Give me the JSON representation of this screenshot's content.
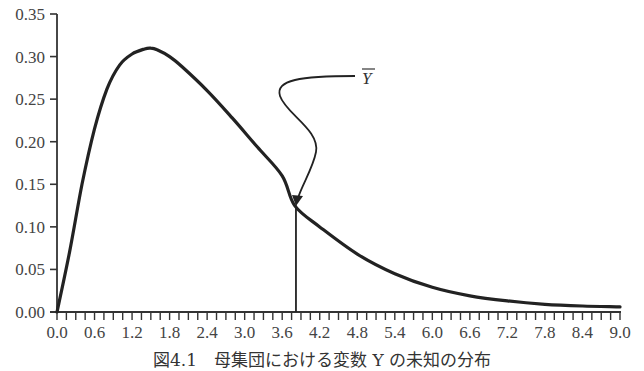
{
  "chart_data": {
    "type": "line",
    "title": "",
    "caption": "図4.1　母集団における変数 Y の未知の分布",
    "xlabel": "",
    "ylabel": "",
    "xlim": [
      0.0,
      9.0
    ],
    "ylim": [
      0.0,
      0.35
    ],
    "grid": false,
    "legend": null,
    "x_tick_labels": [
      "0.0",
      "0.6",
      "1.2",
      "1.8",
      "2.4",
      "3.0",
      "3.6",
      "4.2",
      "4.8",
      "5.4",
      "6.0",
      "6.6",
      "7.2",
      "7.8",
      "8.4",
      "9.0"
    ],
    "x_minor_tick_step": 0.15,
    "y_tick_labels": [
      "0.00",
      "0.05",
      "0.10",
      "0.15",
      "0.20",
      "0.25",
      "0.30",
      "0.35"
    ],
    "series": [
      {
        "name": "Distribution of Y (population)",
        "x": [
          0.0,
          0.2,
          0.4,
          0.6,
          0.8,
          1.0,
          1.2,
          1.4,
          1.5,
          1.6,
          1.8,
          2.0,
          2.4,
          2.8,
          3.2,
          3.6,
          3.8,
          4.2,
          4.8,
          5.4,
          6.0,
          6.6,
          7.2,
          7.8,
          8.4,
          9.0
        ],
        "y": [
          0.0,
          0.07,
          0.15,
          0.215,
          0.262,
          0.29,
          0.303,
          0.309,
          0.31,
          0.308,
          0.3,
          0.288,
          0.26,
          0.228,
          0.194,
          0.16,
          0.125,
          0.1,
          0.068,
          0.045,
          0.029,
          0.019,
          0.013,
          0.009,
          0.007,
          0.006
        ]
      }
    ],
    "annotations": [
      {
        "type": "vertical-line",
        "x": 3.82,
        "y_top": 0.125,
        "label": "Ȳ",
        "label_text": "Y-bar (mean)",
        "arrow": "curved S-shaped arrow from label down to the curve at the mean"
      }
    ]
  },
  "labels": {
    "mean_label": "Y"
  }
}
